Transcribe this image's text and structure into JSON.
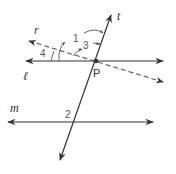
{
  "figure": {
    "point": {
      "label": "P"
    },
    "lines": {
      "t": {
        "label": "t",
        "style": "solid"
      },
      "r": {
        "label": "r",
        "style": "dashed"
      },
      "l": {
        "label": "ℓ",
        "style": "solid"
      },
      "m": {
        "label": "m",
        "style": "solid"
      }
    },
    "angles": [
      {
        "label": "1",
        "between": "l (left) and t (up)"
      },
      {
        "label": "2",
        "between": "m and t (upper-left at m)"
      },
      {
        "label": "3",
        "between": "r and t"
      },
      {
        "label": "4",
        "between": "l and r"
      }
    ],
    "colors": {
      "line": "#333333",
      "dashed": "#555555",
      "label": "#333333",
      "angle_label": "#555555"
    }
  }
}
